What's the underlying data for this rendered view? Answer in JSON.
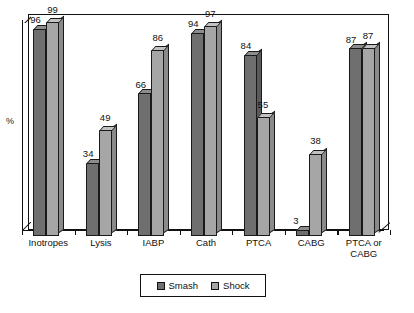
{
  "chart_data": {
    "type": "bar",
    "title": "",
    "subtitle": "",
    "xlabel": "",
    "ylabel": "%",
    "ylim": [
      0,
      100
    ],
    "grid": false,
    "legend_position": "bottom",
    "style": "3d-grouped-column",
    "categories": [
      "Inotropes",
      "Lysis",
      "IABP",
      "Cath",
      "PTCA",
      "CABG",
      "PTCA or\nCABG"
    ],
    "series": [
      {
        "name": "Smash",
        "color": "#6f6f6f",
        "values": [
          96,
          34,
          66,
          94,
          84,
          3,
          87
        ]
      },
      {
        "name": "Shock",
        "color": "#a6a6a6",
        "values": [
          99,
          49,
          86,
          97,
          55,
          38,
          87
        ]
      }
    ],
    "value_labels": [
      [
        "96",
        "99"
      ],
      [
        "34",
        "49"
      ],
      [
        "66",
        "86"
      ],
      [
        "94",
        "97"
      ],
      [
        "84",
        "55"
      ],
      [
        "3",
        "38"
      ],
      [
        "87",
        "87"
      ]
    ]
  },
  "axes": {
    "y_axis_label": "%"
  },
  "legend": {
    "items": [
      {
        "label": "Smash",
        "color": "#6f6f6f"
      },
      {
        "label": "Shock",
        "color": "#a6a6a6"
      }
    ]
  },
  "colors": {
    "smash": "#6f6f6f",
    "shock": "#a6a6a6",
    "outline": "#111111",
    "background": "#ffffff"
  }
}
